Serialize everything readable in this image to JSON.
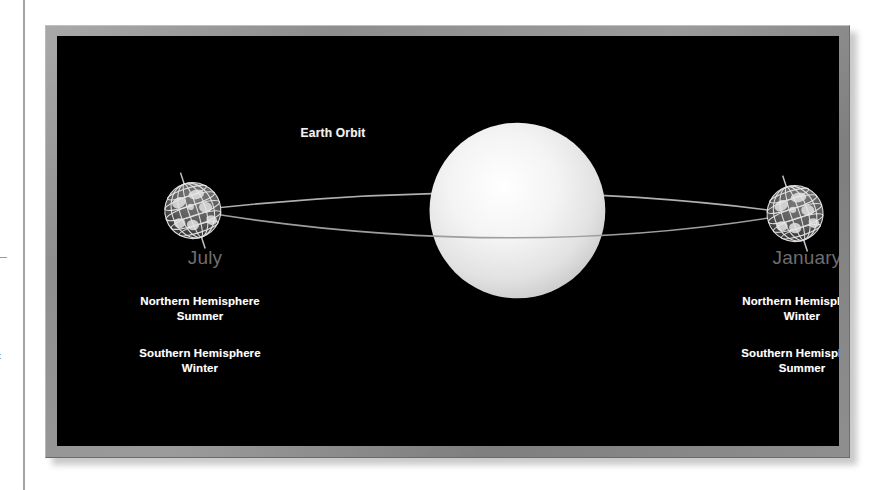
{
  "page": {
    "background_color": "#ffffff",
    "margin_rule_color": "#8e8e8e",
    "margin_fragments": [
      {
        "name": "clipped-dash",
        "text": "—"
      },
      {
        "name": "clipped-letter",
        "text": "t"
      }
    ]
  },
  "figure": {
    "frame_color": "#8e8e8e",
    "panel_background": "#000000",
    "orbit_label": "Earth Orbit",
    "orbit_line_color": "#b4b4b4",
    "sun": {
      "name": "sun",
      "color": "#f0f0f0",
      "center_x": 472,
      "center_y": 185,
      "radius": 88
    },
    "positions": [
      {
        "id": "july",
        "month_label": "July",
        "month_color": "#6e6e6e",
        "globe": {
          "center_x": 147,
          "center_y": 185,
          "radius": 28
        },
        "northern": "Northern Hemisphere\nSummer",
        "southern": "Southern Hemisphere\nWinter",
        "season_color": "#ffffff"
      },
      {
        "id": "january",
        "month_label": "January",
        "month_color": "#6e6e6e",
        "globe": {
          "center_x": 750,
          "center_y": 188,
          "radius": 28
        },
        "northern": "Northern Hemisphere\nWinter",
        "southern": "Southern Hemisphere\nSummer",
        "season_color": "#ffffff"
      }
    ]
  }
}
